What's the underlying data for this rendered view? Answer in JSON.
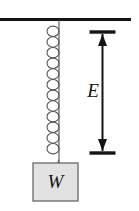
{
  "figure": {
    "background_color": "#ffffff",
    "width": 139,
    "height": 211
  },
  "labels": {
    "extension": "E",
    "weight": "W"
  },
  "diagram": {
    "ceiling": {
      "name": "ceiling-support-line",
      "x1": 0,
      "y1": 19.5,
      "x2": 131,
      "y2": 19.5,
      "color": "#141414",
      "thickness": 3.2
    },
    "spring": {
      "name": "helical-spring",
      "backbone_x": 59,
      "top_y": 20,
      "bottom_y": 162,
      "coil_count": 12,
      "coil_rx": 6,
      "coil_ry": 5.2,
      "color": "#555555",
      "thickness": 1.1
    },
    "block": {
      "name": "hanging-weight-block",
      "x": 33,
      "y": 163,
      "width": 45,
      "height": 38,
      "fill": "#e2e2e2",
      "stroke": "#5e5e5e",
      "stroke_width": 1.2
    },
    "measure": {
      "name": "extension-dimension-arrow",
      "shaft_x": 102.5,
      "top_y": 32,
      "bottom_y": 153,
      "cap_half_width": 13,
      "color": "#141414",
      "shaft_thickness": 2,
      "cap_thickness": 3.4,
      "arrowhead_width": 9,
      "arrowhead_length": 12
    },
    "label_positions": {
      "extension": {
        "x": 93,
        "y": 97
      },
      "weight": {
        "x": 55.5,
        "y": 188
      }
    }
  }
}
